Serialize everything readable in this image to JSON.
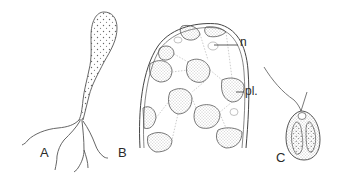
{
  "figure": {
    "panels": [
      {
        "id": "A",
        "label": "A",
        "description": "club-shaped vesicle with rhizoids"
      },
      {
        "id": "B",
        "label": "B",
        "description": "cell apex with plastids and nuclei"
      },
      {
        "id": "C",
        "label": "C",
        "description": "zoospore with flagellum"
      }
    ],
    "annotations": [
      {
        "label": "n",
        "target": "nucleus"
      },
      {
        "label": "pl.",
        "target": "plastid"
      }
    ],
    "colors": {
      "ink": "#3a3a3a",
      "background": "#ffffff"
    }
  }
}
